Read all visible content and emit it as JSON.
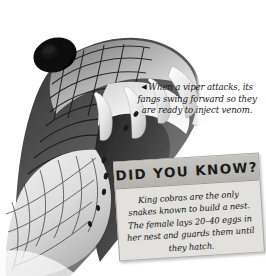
{
  "page": {
    "running_text": "folded away.",
    "rule_color": "#bdbdbd",
    "background_color": "#ffffff"
  },
  "photo": {
    "name": "viper-head-photograph",
    "subject": "Open mouth of a viper showing erect fangs",
    "style": "grayscale photograph",
    "alt": "Close-up black and white photo of a viper's head with its mouth open wide and fangs swung forward"
  },
  "caption": {
    "arrow_glyph": "◀",
    "arrow_icon_name": "left-triangle-icon",
    "text": "When a viper attacks, its fangs swing forward so they are ready to inject venom."
  },
  "did_you_know": {
    "title": "DID YOU KNOW?",
    "body": "King cobras are the only snakes known to build a nest. The female lays 20–40 eggs in her nest and guards them until they hatch.",
    "header_color": "#bcbbb6",
    "body_color": "#e2e1dd",
    "border_color": "#a9a8a4",
    "rotation_degrees": -3.6
  }
}
